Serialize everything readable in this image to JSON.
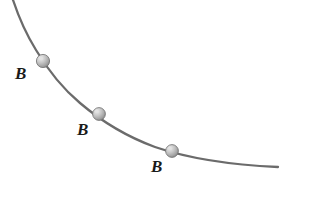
{
  "figure": {
    "width": 332,
    "height": 197,
    "background_color": "#ffffff"
  },
  "curve": {
    "name": "wire",
    "stroke_color": "#6b6b6b",
    "stroke_width": 2.3,
    "path": "M 13 0 C 19 18 26 34 36 50 C 48 70 62 88 80 103 C 100 120 125 136 155 147 C 190 159 234 165 278 167",
    "start_point": [
      13,
      0
    ],
    "end_point": [
      278,
      167
    ]
  },
  "beads": [
    {
      "label": "B",
      "cx": 43,
      "cy": 61,
      "r": 6.6,
      "fill_light": "#e2e2e2",
      "fill_mid": "#b4b4b4",
      "fill_dark": "#8a8a8a",
      "outline": "#6f6f6f",
      "label_x": 15,
      "label_y": 65
    },
    {
      "label": "B",
      "cx": 99,
      "cy": 114,
      "r": 6.4,
      "fill_light": "#e2e2e2",
      "fill_mid": "#b4b4b4",
      "fill_dark": "#8a8a8a",
      "outline": "#6f6f6f",
      "label_x": 77,
      "label_y": 121
    },
    {
      "label": "B",
      "cx": 172,
      "cy": 151,
      "r": 6.4,
      "fill_light": "#e2e2e2",
      "fill_mid": "#b4b4b4",
      "fill_dark": "#8a8a8a",
      "outline": "#6f6f6f",
      "label_x": 151,
      "label_y": 158
    }
  ]
}
